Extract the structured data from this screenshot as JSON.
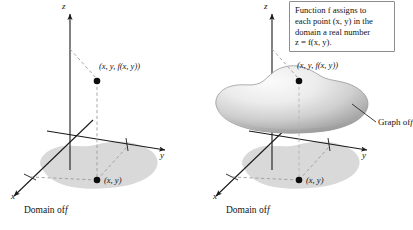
{
  "figure": {
    "title_hidden": "Graph of a function of two variables",
    "background": "#ffffff",
    "ink_color": "#1a1a1a",
    "domain_fill": "#d9d9d9",
    "surface_light": "#f4f4f4",
    "surface_dark": "#9a9a9a"
  },
  "panels": [
    {
      "id": "left",
      "axes": {
        "z": "z",
        "y": "y",
        "x": "x"
      },
      "point_upper_label": "(x, y, f(x, y))",
      "point_lower_label": "(x, y)",
      "caption": "Domain of f",
      "caption_plain": "Domain of",
      "caption_italic": "f",
      "has_surface": false
    },
    {
      "id": "right",
      "axes": {
        "z": "z",
        "y": "y",
        "x": "x"
      },
      "point_upper_label": "(x, y, f(x, y))",
      "point_lower_label": "(x, y)",
      "caption": "Domain of f",
      "caption_plain": "Domain of",
      "caption_italic": "f",
      "has_surface": true,
      "surface_label_plain": "Graph of",
      "surface_label_italic": "f",
      "surface_label": "Graph of f"
    }
  ],
  "note": {
    "lines": [
      "Function f assigns to",
      "each point (x, y) in the",
      "domain a real number",
      "z = f(x, y)."
    ],
    "full_text": "Function f assigns to each point (x, y) in the domain a real number z = f(x, y)."
  }
}
